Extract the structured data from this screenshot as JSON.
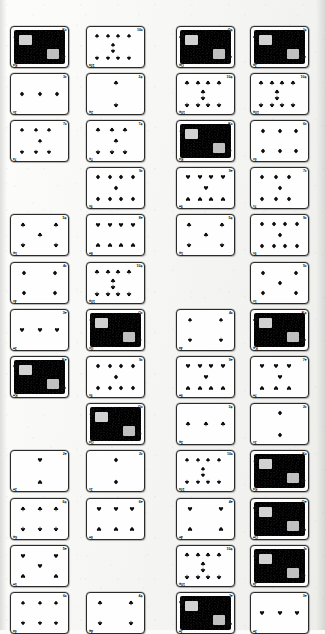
{
  "document": {
    "kind": "scanned-page",
    "title": "Playing Card Grid Scan",
    "description": "Low-resolution scanned page showing a grid of playing cards",
    "background_color": "#f5f5f3",
    "ink_color": "#0d0d0d",
    "card_face_color": "#fefefe",
    "card_border_color": "#2a2a2a"
  },
  "grid": {
    "columns": 4,
    "rows": 13,
    "card_width": 57,
    "card_height": 40,
    "column_x": [
      10,
      86,
      176,
      250
    ],
    "row_y": [
      26,
      73,
      120,
      167,
      214,
      262,
      309,
      356,
      403,
      450,
      498,
      545,
      592
    ]
  },
  "suit_glyphs": {
    "spade": "♠",
    "heart": "♥",
    "diamond": "♦",
    "club": "♣"
  },
  "cards": [
    {
      "row": 0,
      "col": 0,
      "rank": "K",
      "suit": "spade",
      "index": "K♠",
      "court": true,
      "pips": 0
    },
    {
      "row": 0,
      "col": 1,
      "rank": "10",
      "suit": "spade",
      "index": "10♠",
      "court": false,
      "pips": 10
    },
    {
      "row": 0,
      "col": 2,
      "rank": "Q",
      "suit": "club",
      "index": "Q♣",
      "court": true,
      "pips": 0
    },
    {
      "row": 0,
      "col": 3,
      "rank": "J",
      "suit": "club",
      "index": "J♣",
      "court": true,
      "pips": 0
    },
    {
      "row": 1,
      "col": 0,
      "rank": "3",
      "suit": "diamond",
      "index": "3♦",
      "court": false,
      "pips": 3
    },
    {
      "row": 1,
      "col": 1,
      "rank": "2",
      "suit": "club",
      "index": "2♣",
      "court": false,
      "pips": 2
    },
    {
      "row": 1,
      "col": 2,
      "rank": "10",
      "suit": "club",
      "index": "10♣",
      "court": false,
      "pips": 10
    },
    {
      "row": 1,
      "col": 3,
      "rank": "10",
      "suit": "club",
      "index": "10♣",
      "court": false,
      "pips": 10
    },
    {
      "row": 2,
      "col": 0,
      "rank": "7",
      "suit": "spade",
      "index": "7♠",
      "court": false,
      "pips": 7
    },
    {
      "row": 2,
      "col": 1,
      "rank": "7",
      "suit": "club",
      "index": "7♣",
      "court": false,
      "pips": 7
    },
    {
      "row": 2,
      "col": 2,
      "rank": "K",
      "suit": "spade",
      "index": "K♠",
      "court": true,
      "pips": 0
    },
    {
      "row": 2,
      "col": 3,
      "rank": "6",
      "suit": "diamond",
      "index": "6♦",
      "court": false,
      "pips": 6
    },
    {
      "row": 3,
      "col": 1,
      "rank": "9",
      "suit": "diamond",
      "index": "9♦",
      "court": false,
      "pips": 9
    },
    {
      "row": 3,
      "col": 2,
      "rank": "9",
      "suit": "heart",
      "index": "9♥",
      "court": false,
      "pips": 9
    },
    {
      "row": 3,
      "col": 3,
      "rank": "7",
      "suit": "diamond",
      "index": "7♦",
      "court": false,
      "pips": 7
    },
    {
      "row": 4,
      "col": 0,
      "rank": "5",
      "suit": "club",
      "index": "5♣",
      "court": false,
      "pips": 5
    },
    {
      "row": 4,
      "col": 1,
      "rank": "8",
      "suit": "heart",
      "index": "8♥",
      "court": false,
      "pips": 8
    },
    {
      "row": 4,
      "col": 2,
      "rank": "5",
      "suit": "club",
      "index": "5♣",
      "court": false,
      "pips": 5
    },
    {
      "row": 4,
      "col": 3,
      "rank": "9",
      "suit": "diamond",
      "index": "9♦",
      "court": false,
      "pips": 9
    },
    {
      "row": 5,
      "col": 0,
      "rank": "4",
      "suit": "diamond",
      "index": "4♦",
      "court": false,
      "pips": 4
    },
    {
      "row": 5,
      "col": 1,
      "rank": "10",
      "suit": "club",
      "index": "10♣",
      "court": false,
      "pips": 10
    },
    {
      "row": 5,
      "col": 3,
      "rank": "5",
      "suit": "diamond",
      "index": "5♦",
      "court": false,
      "pips": 5
    },
    {
      "row": 6,
      "col": 0,
      "rank": "3",
      "suit": "heart",
      "index": "3♥",
      "court": false,
      "pips": 3
    },
    {
      "row": 6,
      "col": 1,
      "rank": "Q",
      "suit": "diamond",
      "index": "Q♦",
      "court": true,
      "pips": 0
    },
    {
      "row": 6,
      "col": 2,
      "rank": "4",
      "suit": "spade",
      "index": "4♠",
      "court": false,
      "pips": 4
    },
    {
      "row": 6,
      "col": 3,
      "rank": "K",
      "suit": "club",
      "index": "K♣",
      "court": true,
      "pips": 0
    },
    {
      "row": 7,
      "col": 0,
      "rank": "K",
      "suit": "heart",
      "index": "K♥",
      "court": true,
      "pips": 0
    },
    {
      "row": 7,
      "col": 1,
      "rank": "9",
      "suit": "diamond",
      "index": "9♦",
      "court": false,
      "pips": 9
    },
    {
      "row": 7,
      "col": 2,
      "rank": "9",
      "suit": "heart",
      "index": "9♥",
      "court": false,
      "pips": 9
    },
    {
      "row": 7,
      "col": 3,
      "rank": "7",
      "suit": "heart",
      "index": "7♥",
      "court": false,
      "pips": 7
    },
    {
      "row": 8,
      "col": 1,
      "rank": "Q",
      "suit": "spade",
      "index": "Q♠",
      "court": true,
      "pips": 0
    },
    {
      "row": 8,
      "col": 2,
      "rank": "3",
      "suit": "club",
      "index": "3♣",
      "court": false,
      "pips": 3
    },
    {
      "row": 8,
      "col": 3,
      "rank": "2",
      "suit": "diamond",
      "index": "2♦",
      "court": false,
      "pips": 2
    },
    {
      "row": 9,
      "col": 0,
      "rank": "2",
      "suit": "heart",
      "index": "2♥",
      "court": false,
      "pips": 2
    },
    {
      "row": 9,
      "col": 1,
      "rank": "2",
      "suit": "diamond",
      "index": "2♦",
      "court": false,
      "pips": 2
    },
    {
      "row": 9,
      "col": 2,
      "rank": "10",
      "suit": "spade",
      "index": "10♠",
      "court": false,
      "pips": 10
    },
    {
      "row": 9,
      "col": 3,
      "rank": "K",
      "suit": "spade",
      "index": "K♠",
      "court": true,
      "pips": 0
    },
    {
      "row": 10,
      "col": 0,
      "rank": "6",
      "suit": "club",
      "index": "6♣",
      "court": false,
      "pips": 6
    },
    {
      "row": 10,
      "col": 1,
      "rank": "6",
      "suit": "heart",
      "index": "6♥",
      "court": false,
      "pips": 6
    },
    {
      "row": 10,
      "col": 2,
      "rank": "4",
      "suit": "heart",
      "index": "4♥",
      "court": false,
      "pips": 4
    },
    {
      "row": 10,
      "col": 3,
      "rank": "Q",
      "suit": "heart",
      "index": "Q♥",
      "court": true,
      "pips": 0
    },
    {
      "row": 11,
      "col": 0,
      "rank": "5",
      "suit": "heart",
      "index": "5♥",
      "court": false,
      "pips": 5
    },
    {
      "row": 11,
      "col": 2,
      "rank": "10",
      "suit": "club",
      "index": "10♣",
      "court": false,
      "pips": 10
    },
    {
      "row": 11,
      "col": 3,
      "rank": "J",
      "suit": "spade",
      "index": "J♠",
      "court": true,
      "pips": 0
    },
    {
      "row": 12,
      "col": 0,
      "rank": "6",
      "suit": "spade",
      "index": "6♠",
      "court": false,
      "pips": 6
    },
    {
      "row": 12,
      "col": 1,
      "rank": "4",
      "suit": "club",
      "index": "4♣",
      "court": false,
      "pips": 4
    },
    {
      "row": 12,
      "col": 2,
      "rank": "J",
      "suit": "heart",
      "index": "J♥",
      "court": true,
      "pips": 0
    },
    {
      "row": 12,
      "col": 3,
      "rank": "3",
      "suit": "heart",
      "index": "3♥",
      "court": false,
      "pips": 3
    }
  ]
}
